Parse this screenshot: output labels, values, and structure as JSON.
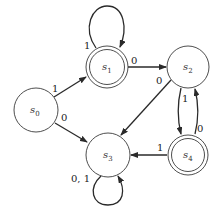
{
  "diagram": {
    "type": "finite-state-automaton",
    "states": [
      {
        "id": "s0",
        "name": "s",
        "sub": "0",
        "accepting": false
      },
      {
        "id": "s1",
        "name": "s",
        "sub": "1",
        "accepting": true
      },
      {
        "id": "s2",
        "name": "s",
        "sub": "2",
        "accepting": false
      },
      {
        "id": "s3",
        "name": "s",
        "sub": "3",
        "accepting": false
      },
      {
        "id": "s4",
        "name": "s",
        "sub": "4",
        "accepting": true
      }
    ],
    "transitions": [
      {
        "from": "s0",
        "to": "s1",
        "label": "1"
      },
      {
        "from": "s0",
        "to": "s3",
        "label": "0"
      },
      {
        "from": "s1",
        "to": "s1",
        "label": "1"
      },
      {
        "from": "s1",
        "to": "s2",
        "label": "0"
      },
      {
        "from": "s2",
        "to": "s3",
        "label": "0"
      },
      {
        "from": "s2",
        "to": "s4",
        "label": "1"
      },
      {
        "from": "s4",
        "to": "s2",
        "label": "0"
      },
      {
        "from": "s4",
        "to": "s3",
        "label": "1"
      },
      {
        "from": "s3",
        "to": "s3",
        "label": "0, 1"
      }
    ]
  }
}
